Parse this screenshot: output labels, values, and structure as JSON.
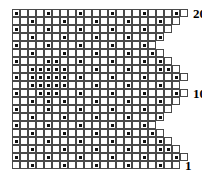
{
  "chart": {
    "type": "grid-stitch-chart",
    "rows": 20,
    "max_columns": 22,
    "cell_size_px": 8,
    "origin": {
      "x": 12,
      "y": 9
    },
    "grid_line_color": "#4a4a4a",
    "dot_color": "#111111",
    "background_color": "#ffffff",
    "row_numbering": "bottom-to-top",
    "row_labels": [
      {
        "row": 20,
        "text": "20"
      },
      {
        "row": 10,
        "text": "10"
      },
      {
        "row": 1,
        "text": "1"
      }
    ],
    "row_widths": [
      22,
      21,
      20,
      19,
      18,
      19,
      20,
      21,
      22,
      21,
      22,
      21,
      20,
      19,
      18,
      19,
      20,
      21,
      22,
      21
    ],
    "marked_cells": [
      {
        "row": 20,
        "cols": [
          1,
          5,
          9,
          13,
          17,
          21
        ]
      },
      {
        "row": 19,
        "cols": [
          3,
          7,
          11,
          15,
          19
        ]
      },
      {
        "row": 18,
        "cols": [
          1,
          5,
          9,
          13,
          17
        ]
      },
      {
        "row": 17,
        "cols": [
          3,
          7,
          11,
          15,
          19
        ]
      },
      {
        "row": 16,
        "cols": [
          1,
          5,
          9,
          13,
          17
        ]
      },
      {
        "row": 15,
        "cols": [
          3,
          7,
          11,
          15,
          18
        ]
      },
      {
        "row": 14,
        "cols": [
          1,
          5,
          6,
          9,
          13,
          17,
          19
        ]
      },
      {
        "row": 13,
        "cols": [
          3,
          4,
          5,
          6,
          7,
          11,
          15,
          19,
          20
        ]
      },
      {
        "row": 12,
        "cols": [
          1,
          3,
          4,
          5,
          6,
          7,
          9,
          13,
          17,
          21
        ]
      },
      {
        "row": 11,
        "cols": [
          3,
          4,
          5,
          6,
          7,
          11,
          15,
          19
        ]
      },
      {
        "row": 10,
        "cols": [
          1,
          4,
          5,
          6,
          9,
          13,
          17,
          21
        ]
      },
      {
        "row": 9,
        "cols": [
          3,
          5,
          7,
          11,
          15,
          19
        ]
      },
      {
        "row": 8,
        "cols": [
          1,
          5,
          9,
          13,
          17
        ]
      },
      {
        "row": 7,
        "cols": [
          3,
          7,
          11,
          15,
          19
        ]
      },
      {
        "row": 6,
        "cols": [
          1,
          5,
          9,
          13,
          17
        ]
      },
      {
        "row": 5,
        "cols": [
          3,
          7,
          11,
          15,
          18
        ]
      },
      {
        "row": 4,
        "cols": [
          1,
          5,
          9,
          13,
          17,
          19
        ]
      },
      {
        "row": 3,
        "cols": [
          3,
          7,
          11,
          15,
          19,
          20
        ]
      },
      {
        "row": 2,
        "cols": [
          1,
          5,
          9,
          13,
          17,
          21
        ]
      },
      {
        "row": 1,
        "cols": [
          3,
          7,
          11,
          15,
          19
        ]
      }
    ]
  }
}
